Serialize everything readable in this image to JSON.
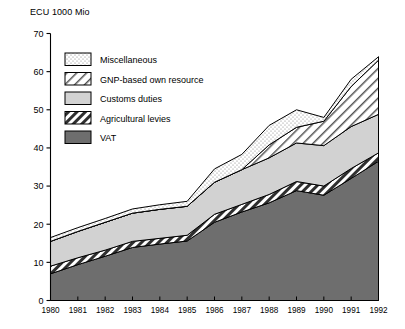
{
  "chart_data": {
    "type": "area",
    "stacked": true,
    "title": "",
    "ylabel": "ECU 1000 Mio",
    "xlabel": "",
    "ylim": [
      0,
      70
    ],
    "ytick_step": 10,
    "yticks": [
      0,
      10,
      20,
      30,
      40,
      50,
      60,
      70
    ],
    "grid": false,
    "legend_position": "inside-top-left",
    "categories": [
      "1980",
      "1981",
      "1982",
      "1983",
      "1984",
      "1985",
      "1986",
      "1987",
      "1988",
      "1989",
      "1990",
      "1991",
      "1992"
    ],
    "x": [
      1980,
      1981,
      1982,
      1983,
      1984,
      1985,
      1986,
      1987,
      1988,
      1989,
      1990,
      1991,
      1992
    ],
    "series": [
      {
        "name": "VAT",
        "order": 1,
        "fill": "#6e6e6e",
        "pattern": "solid",
        "values": [
          7.0,
          9.4,
          11.6,
          13.9,
          14.8,
          15.6,
          20.5,
          23.2,
          25.6,
          28.8,
          27.6,
          32.0,
          36.5
        ]
      },
      {
        "name": "Agricultural levies",
        "order": 2,
        "fill": "#3c3c3c",
        "pattern": "diagonal-hatch-dark",
        "values": [
          2.0,
          1.8,
          1.6,
          1.6,
          1.5,
          1.5,
          2.1,
          2.0,
          2.2,
          2.4,
          2.4,
          2.6,
          2.2
        ]
      },
      {
        "name": "Customs duties",
        "order": 3,
        "fill": "#d2d2d2",
        "pattern": "solid",
        "values": [
          6.5,
          6.9,
          7.3,
          7.4,
          7.6,
          7.6,
          8.4,
          9.1,
          9.6,
          10.1,
          10.6,
          11.0,
          10.1
        ]
      },
      {
        "name": "GNP-based own resource",
        "order": 4,
        "fill": "#ffffff",
        "pattern": "diagonal-hatch-light",
        "values": [
          0,
          0,
          0,
          0,
          0,
          0,
          0,
          0,
          3.4,
          4.1,
          6.4,
          10.5,
          14.2
        ]
      },
      {
        "name": "Miscellaneous",
        "order": 5,
        "fill": "#ffffff",
        "pattern": "dotted",
        "values": [
          1.0,
          1.0,
          1.0,
          1.1,
          1.2,
          1.3,
          3.5,
          4.0,
          5.1,
          4.6,
          1.0,
          1.9,
          0.9
        ]
      }
    ],
    "totals": [
      16.5,
      19.1,
      21.5,
      24.0,
      25.1,
      26.0,
      34.5,
      38.3,
      45.9,
      50.0,
      48.0,
      58.0,
      63.9
    ],
    "legend_entries": [
      "Miscellaneous",
      "GNP-based own resource",
      "Customs duties",
      "Agricultural levies",
      "VAT"
    ]
  },
  "colors": {
    "vat": "#6e6e6e",
    "agricultural_levies": "#3c3c3c",
    "customs_duties": "#d2d2d2",
    "gnp_resource": "#ffffff",
    "miscellaneous": "#ffffff",
    "axis": "#000000"
  }
}
